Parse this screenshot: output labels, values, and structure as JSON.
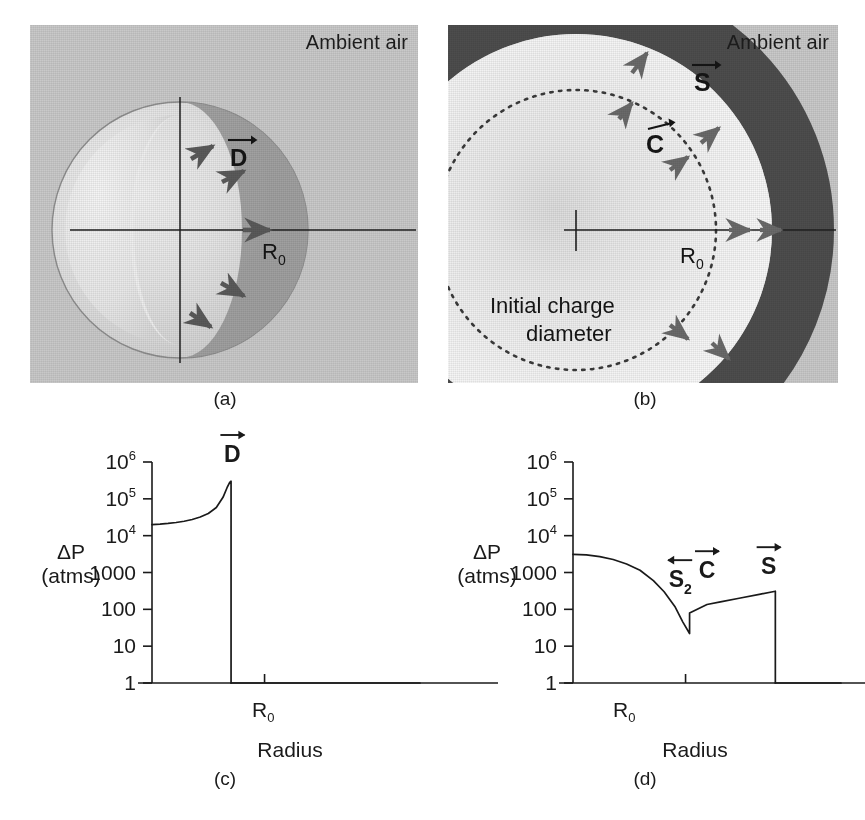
{
  "figure": {
    "panels": [
      {
        "id": "a",
        "caption": "(a)",
        "ambient_label": "Ambient air",
        "vector_label": "D",
        "radius_label": "R",
        "radius_sub": "0",
        "arrow_count": 5
      },
      {
        "id": "b",
        "caption": "(b)",
        "ambient_label": "Ambient air",
        "vector_labels": [
          "S",
          "C"
        ],
        "radius_label": "R",
        "radius_sub": "0",
        "annotation_line1": "Initial charge",
        "annotation_line2": "diameter",
        "arrow_count": 8
      },
      {
        "id": "c",
        "caption": "(c)"
      },
      {
        "id": "d",
        "caption": "(d)"
      }
    ]
  },
  "colors": {
    "background_air": "#c9c9c9",
    "sphere_light": "#e3e3e3",
    "sphere_shell": "#9a9a9a",
    "dark_ring": "#4d4d4d",
    "bright_ring": "#f2f2f2",
    "axis": "#1a1a1a",
    "arrow": "#555555"
  },
  "chart_data": [
    {
      "type": "line",
      "panel": "c",
      "title": "",
      "xlabel": "Radius",
      "ylabel": "ΔP",
      "ylabel_unit": "(atms)",
      "yscale": "log",
      "ylim": [
        1,
        1000000
      ],
      "ytick_labels": [
        "10⁶",
        "10⁵",
        "10⁴",
        "1000",
        "100",
        "10",
        "1"
      ],
      "ytick_values": [
        1000000,
        100000,
        10000,
        1000,
        100,
        10,
        1
      ],
      "ytick_mantissas": [
        "10",
        "10",
        "10",
        "1000",
        "100",
        "10",
        "1"
      ],
      "ytick_exponents": [
        "6",
        "5",
        "4",
        "",
        "",
        "",
        ""
      ],
      "xtick_labels": [
        "R₀"
      ],
      "xtick_positions": [
        0.42
      ],
      "annotations": [
        {
          "text": "D",
          "arrow": "right",
          "x": 0.3,
          "y": 1000000
        }
      ],
      "grid": false,
      "legend": null,
      "series": [
        {
          "name": "detonation pressure profile",
          "x": [
            0.0,
            0.03,
            0.06,
            0.09,
            0.12,
            0.15,
            0.18,
            0.21,
            0.24,
            0.265,
            0.28,
            0.29,
            0.295,
            0.295,
            0.295
          ],
          "y": [
            20000,
            20600,
            21500,
            22800,
            24600,
            27500,
            32000,
            40000,
            58000,
            110000,
            200000,
            280000,
            300000,
            1.0,
            1.0
          ]
        },
        {
          "name": "ambient baseline",
          "x": [
            0.295,
            1.0
          ],
          "y": [
            1.0,
            1.0
          ]
        }
      ]
    },
    {
      "type": "line",
      "panel": "d",
      "title": "",
      "xlabel": "Radius",
      "ylabel": "ΔP",
      "ylabel_unit": "(atms)",
      "yscale": "log",
      "ylim": [
        1,
        1000000
      ],
      "ytick_labels": [
        "10⁶",
        "10⁵",
        "10⁴",
        "1000",
        "100",
        "10",
        "1"
      ],
      "ytick_values": [
        1000000,
        100000,
        10000,
        1000,
        100,
        10,
        1
      ],
      "ytick_mantissas": [
        "10",
        "10",
        "10",
        "1000",
        "100",
        "10",
        "1"
      ],
      "ytick_exponents": [
        "6",
        "5",
        "4",
        "",
        "",
        "",
        ""
      ],
      "xtick_labels": [
        "R₀"
      ],
      "xtick_positions": [
        0.42
      ],
      "annotations": [
        {
          "text": "S",
          "sub": "2",
          "arrow": "left",
          "x": 0.4,
          "y": 400
        },
        {
          "text": "C",
          "sub": "",
          "arrow": "right",
          "x": 0.5,
          "y": 700
        },
        {
          "text": "S",
          "sub": "",
          "arrow": "right",
          "x": 0.73,
          "y": 900
        }
      ],
      "grid": false,
      "legend": null,
      "series": [
        {
          "name": "blast wave pressure profile",
          "x": [
            0.0,
            0.05,
            0.1,
            0.15,
            0.2,
            0.25,
            0.3,
            0.34,
            0.38,
            0.41,
            0.435,
            0.435,
            0.5,
            0.55,
            0.62,
            0.7,
            0.755,
            0.755
          ],
          "y": [
            3100,
            3000,
            2700,
            2250,
            1700,
            1150,
            600,
            300,
            120,
            45,
            22,
            80,
            135,
            160,
            200,
            260,
            310,
            1.0
          ]
        },
        {
          "name": "ambient baseline",
          "x": [
            0.755,
            1.0
          ],
          "y": [
            1.0,
            1.0
          ]
        }
      ]
    }
  ]
}
